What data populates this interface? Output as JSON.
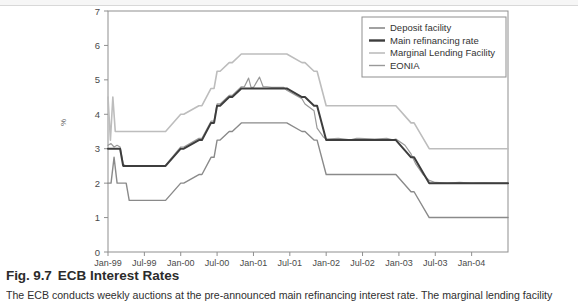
{
  "figure": {
    "caption_number": "Fig. 9.7",
    "caption_title": "ECB Interest Rates",
    "caption_body": "The ECB conducts weekly auctions at the pre-announced main refinancing interest rate. The marginal lending facility"
  },
  "chart_data": {
    "type": "line",
    "title": "",
    "xlabel": "",
    "ylabel": "%",
    "ylim": [
      0,
      7
    ],
    "ytick_labels": [
      "0",
      "1",
      "2",
      "3",
      "4",
      "5",
      "6",
      "7"
    ],
    "ytick_values": [
      0,
      1,
      2,
      3,
      4,
      5,
      6,
      7
    ],
    "xtick_labels": [
      "Jan-99",
      "Jul-99",
      "Jan-00",
      "Jul-00",
      "Jan-01",
      "Jul-01",
      "Jan-02",
      "Jul-02",
      "Jan-03",
      "Jul-03",
      "Jan-04"
    ],
    "xtick_values": [
      0,
      6,
      12,
      18,
      24,
      30,
      36,
      42,
      48,
      54,
      60
    ],
    "xlim": [
      0,
      66
    ],
    "grid": false,
    "legend_position": "top-right",
    "series": [
      {
        "name": "Deposit facility",
        "color": "#8a8a8a",
        "width": 1.4,
        "x": [
          0,
          0.5,
          1,
          1.5,
          2,
          2.5,
          3,
          3.5,
          4,
          9,
          9.5,
          12,
          12.5,
          15,
          15.5,
          17,
          17.5,
          18,
          18.5,
          20,
          20.5,
          22,
          22.5,
          24,
          29,
          29.5,
          32,
          32.5,
          34,
          34.5,
          36,
          41,
          41.5,
          47,
          47.5,
          50,
          50.5,
          53,
          53.5,
          66
        ],
        "values": [
          2.0,
          2.0,
          2.75,
          2.0,
          2.0,
          2.0,
          2.0,
          1.5,
          1.5,
          1.5,
          1.5,
          2.0,
          2.0,
          2.25,
          2.25,
          2.75,
          2.75,
          3.25,
          3.25,
          3.5,
          3.5,
          3.75,
          3.75,
          3.75,
          3.75,
          3.75,
          3.5,
          3.5,
          3.25,
          3.25,
          2.25,
          2.25,
          2.25,
          2.25,
          2.25,
          1.75,
          1.75,
          1.0,
          1.0,
          1.0
        ]
      },
      {
        "name": "Main refinancing rate",
        "color": "#3d3d3d",
        "width": 2.0,
        "x": [
          0,
          0.5,
          1,
          1.5,
          2,
          2.5,
          3,
          3.5,
          4,
          9,
          9.5,
          12,
          12.5,
          15,
          15.5,
          17,
          17.5,
          18,
          18.5,
          20,
          20.5,
          22,
          22.5,
          24,
          29,
          29.5,
          32,
          32.5,
          34,
          34.5,
          36,
          41,
          41.5,
          47,
          47.5,
          50,
          50.5,
          53,
          53.5,
          66
        ],
        "values": [
          3.0,
          3.0,
          3.0,
          3.0,
          3.0,
          2.5,
          2.5,
          2.5,
          2.5,
          2.5,
          2.5,
          3.0,
          3.0,
          3.25,
          3.25,
          3.75,
          3.75,
          4.25,
          4.25,
          4.5,
          4.5,
          4.75,
          4.75,
          4.75,
          4.75,
          4.75,
          4.5,
          4.5,
          4.25,
          4.25,
          3.25,
          3.25,
          3.25,
          3.25,
          3.25,
          2.75,
          2.75,
          2.0,
          2.0,
          2.0
        ]
      },
      {
        "name": "Marginal Lending Facility",
        "color": "#bdbdbd",
        "width": 1.6,
        "x": [
          0,
          0.4,
          0.8,
          1.2,
          1.6,
          2,
          2.5,
          3,
          3.5,
          4,
          9,
          9.5,
          12,
          12.5,
          15,
          15.5,
          17,
          17.5,
          18,
          18.5,
          20,
          20.5,
          22,
          22.5,
          24,
          29,
          29.5,
          32,
          32.5,
          34,
          34.5,
          36,
          41,
          41.5,
          47,
          47.5,
          50,
          50.5,
          53,
          53.5,
          66
        ],
        "values": [
          4.5,
          3.25,
          4.5,
          3.5,
          3.5,
          3.5,
          3.5,
          3.5,
          3.5,
          3.5,
          3.5,
          3.5,
          4.0,
          4.0,
          4.25,
          4.25,
          4.75,
          4.75,
          5.25,
          5.25,
          5.5,
          5.5,
          5.75,
          5.75,
          5.75,
          5.75,
          5.75,
          5.5,
          5.5,
          5.25,
          5.25,
          4.25,
          4.25,
          4.25,
          4.25,
          4.25,
          3.75,
          3.75,
          3.0,
          3.0,
          3.0
        ]
      },
      {
        "name": "EONIA",
        "color": "#999999",
        "width": 1.2,
        "x": [
          0,
          0.5,
          1,
          1.5,
          2,
          2.5,
          3,
          3.5,
          4,
          9,
          9.5,
          12,
          12.5,
          15,
          15.5,
          17,
          17.5,
          18,
          18.5,
          20,
          20.5,
          22,
          22.5,
          23.2,
          23.6,
          24,
          25,
          25.6,
          26.2,
          27,
          29,
          29.5,
          32,
          32.5,
          34,
          34.5,
          35.5,
          36,
          38,
          40,
          41,
          41.5,
          44,
          46,
          47,
          47.5,
          49,
          50,
          50.8,
          52,
          53,
          54,
          56,
          58,
          60,
          62,
          64,
          66
        ],
        "values": [
          3.1,
          3.15,
          3.05,
          3.1,
          3.05,
          2.55,
          2.5,
          2.5,
          2.5,
          2.5,
          2.52,
          3.05,
          3.05,
          3.3,
          3.3,
          3.8,
          3.8,
          4.3,
          4.3,
          4.55,
          4.55,
          4.8,
          4.8,
          5.05,
          4.78,
          4.78,
          5.08,
          4.8,
          4.8,
          4.78,
          4.78,
          4.7,
          4.45,
          4.3,
          4.1,
          3.6,
          3.35,
          3.28,
          3.3,
          3.26,
          3.3,
          3.3,
          3.28,
          3.3,
          3.26,
          3.28,
          3.1,
          2.85,
          2.55,
          2.25,
          2.08,
          2.02,
          2.0,
          2.02,
          2.0,
          2.01,
          2.0,
          2.0
        ]
      }
    ]
  },
  "legend": {
    "items": [
      {
        "label": "Deposit facility",
        "color": "#8a8a8a",
        "width": 1.6
      },
      {
        "label": "Main refinancing rate",
        "color": "#3d3d3d",
        "width": 2.4
      },
      {
        "label": "Marginal Lending Facility",
        "color": "#bdbdbd",
        "width": 1.6
      },
      {
        "label": "EONIA",
        "color": "#999999",
        "width": 1.4
      }
    ]
  },
  "axes": {
    "axis_color": "#8f8f8f",
    "tick_text_color": "#4a4a4a"
  }
}
